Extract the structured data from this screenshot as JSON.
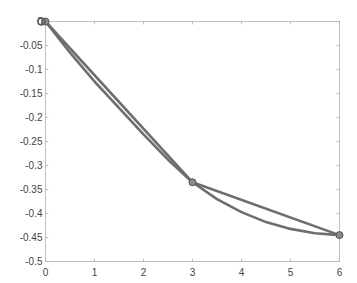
{
  "chart_data": {
    "type": "line",
    "title": "",
    "xlabel": "",
    "ylabel": "",
    "xlim": [
      0,
      6
    ],
    "ylim": [
      -0.5,
      0
    ],
    "grid": false,
    "legend": null,
    "x_ticks": [
      "0",
      "1",
      "2",
      "3",
      "4",
      "5",
      "6"
    ],
    "y_ticks": [
      "0",
      "-0.05",
      "-0.1",
      "-0.15",
      "-0.2",
      "-0.25",
      "-0.3",
      "-0.35",
      "-0.4",
      "-0.45",
      "-0.5"
    ],
    "series": [
      {
        "name": "piecewise-linear",
        "style": "line-with-markers",
        "x": [
          0,
          3,
          6
        ],
        "y": [
          0,
          -0.335,
          -0.445
        ]
      },
      {
        "name": "smooth-curve",
        "style": "line",
        "x": [
          0,
          0.5,
          1,
          1.5,
          2,
          2.5,
          3,
          3.5,
          4,
          4.5,
          5,
          5.5,
          6
        ],
        "y": [
          0,
          -0.065,
          -0.125,
          -0.18,
          -0.235,
          -0.288,
          -0.335,
          -0.37,
          -0.397,
          -0.418,
          -0.432,
          -0.441,
          -0.445
        ]
      }
    ],
    "markers": [
      {
        "x": 0,
        "y": 0
      },
      {
        "x": 3,
        "y": -0.335
      },
      {
        "x": 6,
        "y": -0.445
      }
    ],
    "colors": {
      "line": "#6e6e6e",
      "axis": "#b0b0b0",
      "marker_face": "#8a8a8a"
    }
  }
}
